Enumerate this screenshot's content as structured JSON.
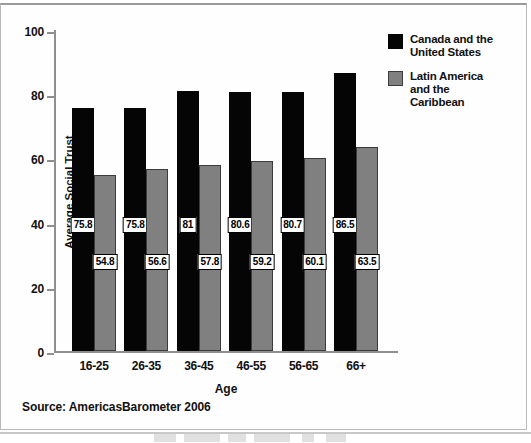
{
  "chart_data": {
    "type": "bar",
    "title": "",
    "xlabel": "Age",
    "ylabel": "Average Social Trust",
    "ylim": [
      0,
      100
    ],
    "yticks": [
      0,
      20,
      40,
      60,
      80,
      100
    ],
    "grid": false,
    "legend_position": "top-right",
    "categories": [
      "16-25",
      "26-35",
      "36-45",
      "46-55",
      "56-65",
      "66+"
    ],
    "series": [
      {
        "name": "Canada and the United States",
        "color": "#050505",
        "values": [
          75.8,
          75.8,
          81,
          80.6,
          80.7,
          86.5
        ],
        "labels": [
          "75.8",
          "75.8",
          "81",
          "80.6",
          "80.7",
          "86.5"
        ]
      },
      {
        "name": "Latin America and the Caribbean",
        "color": "#808080",
        "values": [
          54.8,
          56.6,
          57.8,
          59.2,
          60.1,
          63.5
        ],
        "labels": [
          "54.8",
          "56.6",
          "57.8",
          "59.2",
          "60.1",
          "63.5"
        ]
      }
    ],
    "annotations": [
      "Source: AmericasBarometer 2006"
    ]
  },
  "axes": {
    "y_label": "Average Social Trust",
    "x_label": "Age",
    "y_ticks": [
      "0",
      "20",
      "40",
      "60",
      "80",
      "100"
    ],
    "x_ticks": [
      "16-25",
      "26-35",
      "36-45",
      "46-55",
      "56-65",
      "66+"
    ]
  },
  "legend": {
    "items": [
      {
        "label": "Canada and the\nUnited States",
        "line1": "Canada and the",
        "line2": "United States",
        "swatch": "dark-swatch"
      },
      {
        "label": "Latin America and the Caribbean",
        "line1": "Latin America",
        "line2": "and the",
        "line3": "Caribbean",
        "swatch": "gray-swatch"
      }
    ]
  },
  "source": {
    "text": "Source: AmericasBarometer 2006"
  },
  "colors": {
    "series_dark": "#050505",
    "series_gray": "#808080",
    "axis": "#8f8f8f",
    "text": "#111111",
    "background": "#ffffff"
  }
}
